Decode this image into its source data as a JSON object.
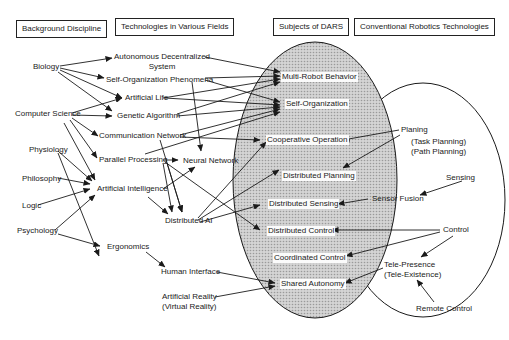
{
  "headers": {
    "background": "Background Discipline",
    "technologies": "Technologies in Various Fields",
    "subjects": "Subjects of DARS",
    "conventional": "Conventional Robotics Technologies"
  },
  "disciplines": {
    "biology": "Biology",
    "computer_science": "Computer Science",
    "physiology": "Physiology",
    "philosophy": "Philosophy",
    "logic": "Logic",
    "psychology": "Psychology"
  },
  "technologies": {
    "ads_line1": "Autonomous Decentralized",
    "ads_line2": "System",
    "self_org_phenomena": "Self-Organization Phenomena",
    "artificial_life": "Artificial Life",
    "genetic_algorithm": "Genetic Algorithm",
    "communication_network": "Communication Network",
    "parallel_processing": "Parallel Processing",
    "neural_network": "Neural Network",
    "artificial_intelligence": "Artificial Intelligence",
    "distributed_ai": "Distributed AI",
    "ergonomics": "Ergonomics",
    "human_interface": "Human Interface",
    "artificial_reality_line1": "Artificial Reality",
    "artificial_reality_line2": "(Virtual Reality)"
  },
  "subjects": {
    "multi_robot_behavior": "Multi-Robot Behavior",
    "self_organization": "Self-Organization",
    "cooperative_operation": "Cooperative Operation",
    "distributed_planning": "Distributed Planning",
    "distributed_sensing": "Distributed Sensing",
    "distributed_control": "Distributed Control",
    "coordinated_control": "Coordinated Control",
    "shared_autonomy": "Shared Autonomy"
  },
  "conventional": {
    "planing": "Planing",
    "task_planning": "(Task Planning)",
    "path_planning": "(Path Planning)",
    "sensing": "Sensing",
    "sensor_fusion": "Sensor Fusion",
    "control": "Control",
    "tele_presence": "Tele-Presence",
    "tele_existence": "(Tele-Existence)",
    "remote_control": "Remote Control"
  },
  "colors": {
    "shade_fill": "#cfcfcf",
    "line": "#1a1a1a"
  }
}
